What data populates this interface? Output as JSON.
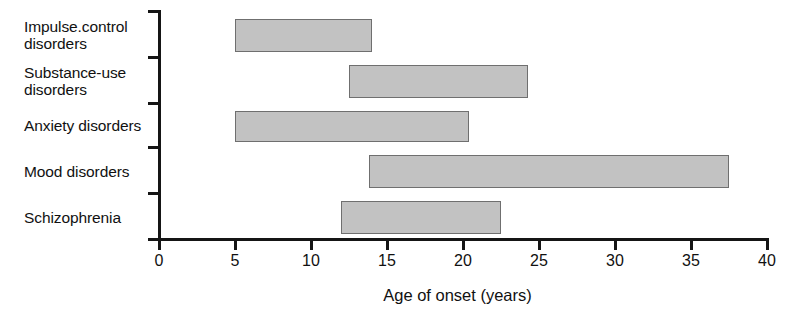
{
  "chart_data": {
    "type": "bar",
    "orientation": "horizontal",
    "subtype": "range-bar",
    "title": "",
    "xlabel": "Age of onset (years)",
    "ylabel": "",
    "xlim": [
      0,
      40
    ],
    "xticks": [
      0,
      5,
      10,
      15,
      20,
      25,
      30,
      35,
      40
    ],
    "xtick_labels": [
      "0",
      "5",
      "10",
      "15",
      "20",
      "25",
      "30",
      "35",
      "40"
    ],
    "grid": false,
    "legend": "none",
    "categories": [
      "Impulse.control disorders",
      "Substance-use disorders",
      "Anxiety disorders",
      "Mood disorders",
      "Schizophrenia"
    ],
    "ranges": [
      {
        "category": "Impulse.control disorders",
        "start": 5.0,
        "end": 14.0
      },
      {
        "category": "Substance-use disorders",
        "start": 12.5,
        "end": 24.3
      },
      {
        "category": "Anxiety disorders",
        "start": 5.0,
        "end": 20.4
      },
      {
        "category": "Mood disorders",
        "start": 13.8,
        "end": 37.5
      },
      {
        "category": "Schizophrenia",
        "start": 12.0,
        "end": 22.5
      }
    ],
    "bar_fill_color": "#c2c2c2",
    "bar_edge_color": "#6f6f6f",
    "axis_color": "#151515"
  },
  "labels": {
    "cat0": "Impulse.control\ndisorders",
    "cat1": "Substance-use\ndisorders",
    "cat2": "Anxiety disorders",
    "cat3": "Mood disorders",
    "cat4": "Schizophrenia"
  },
  "axis": {
    "x_title": "Age of onset (years)",
    "ticks": [
      "0",
      "5",
      "10",
      "15",
      "20",
      "25",
      "30",
      "35",
      "40"
    ]
  }
}
